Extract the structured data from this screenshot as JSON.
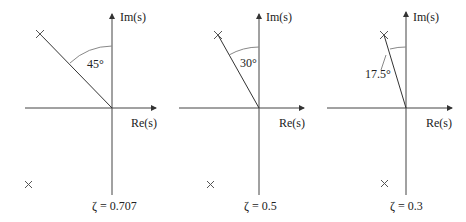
{
  "panels": [
    {
      "axis_im": "Im(s)",
      "axis_re": "Re(s)",
      "angle_label": "45°",
      "zeta_label": "ζ = 0.707",
      "zeta": 0.707,
      "angle_deg": 45
    },
    {
      "axis_im": "Im(s)",
      "axis_re": "Re(s)",
      "angle_label": "30°",
      "zeta_label": "ζ = 0.5",
      "zeta": 0.5,
      "angle_deg": 30
    },
    {
      "axis_im": "Im(s)",
      "axis_re": "Re(s)",
      "angle_label": "17.5°",
      "zeta_label": "ζ = 0.3",
      "zeta": 0.3,
      "angle_deg": 17.5
    }
  ],
  "colors": {
    "axis": "#444444",
    "arc": "#888888",
    "line": "#333333"
  }
}
